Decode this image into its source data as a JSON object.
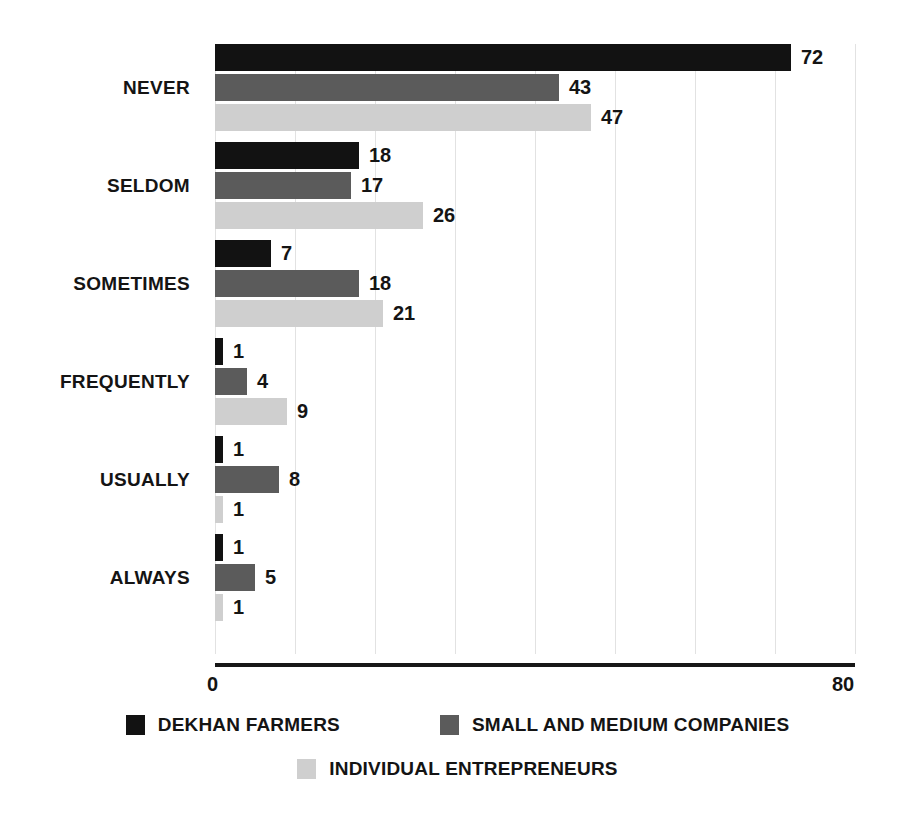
{
  "chart_data": {
    "type": "bar",
    "orientation": "horizontal",
    "title": "",
    "xlabel": "",
    "ylabel": "",
    "xlim": [
      0,
      80
    ],
    "grid": true,
    "grid_axis": "x",
    "gridline_step": 10,
    "legend_position": "bottom",
    "axis_ticks_shown": [
      "0",
      "80"
    ],
    "categories": [
      "NEVER",
      "SELDOM",
      "SOMETIMES",
      "FREQUENTLY",
      "USUALLY",
      "ALWAYS"
    ],
    "series": [
      {
        "name": "DEKHAN FARMERS",
        "color": "#121212",
        "values": [
          72,
          18,
          7,
          1,
          1,
          1
        ]
      },
      {
        "name": "SMALL AND MEDIUM COMPANIES",
        "color": "#5b5b5b",
        "values": [
          43,
          17,
          18,
          4,
          8,
          5
        ]
      },
      {
        "name": "INDIVIDUAL ENTREPRENEURS",
        "color": "#cfcfcf",
        "values": [
          47,
          26,
          21,
          9,
          1,
          1
        ]
      }
    ]
  },
  "axis": {
    "min_label": "0",
    "max_label": "80"
  },
  "legend": {
    "items": [
      {
        "label": "DEKHAN FARMERS",
        "swatch": "#121212"
      },
      {
        "label": "SMALL AND MEDIUM COMPANIES",
        "swatch": "#5b5b5b"
      },
      {
        "label": "INDIVIDUAL ENTREPRENEURS",
        "swatch": "#cfcfcf"
      }
    ]
  },
  "colors": {
    "series_1": "#121212",
    "series_2": "#5b5b5b",
    "series_3": "#cfcfcf",
    "gridline": "#e2e2e2",
    "axis": "#171717",
    "text": "#141414",
    "background": "#ffffff"
  }
}
